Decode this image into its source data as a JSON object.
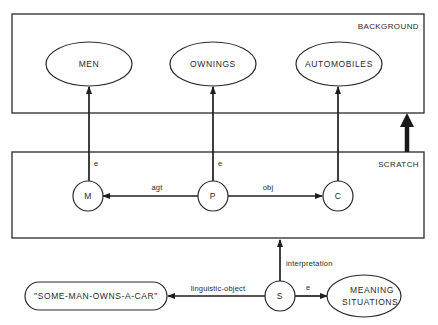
{
  "colors": {
    "ink": "#2a2a2a",
    "background": "#ffffff"
  },
  "boxes": {
    "background": {
      "label": "BACKGROUND"
    },
    "scratch": {
      "label": "SCRATCH"
    }
  },
  "concepts": {
    "men": "MEN",
    "ownings": "OWNINGS",
    "automobiles": "AUTOMOBILES"
  },
  "nodes": {
    "m": "M",
    "p": "P",
    "c": "C",
    "s": "S"
  },
  "edges": {
    "m_to_men": "e",
    "p_to_ownings": "e",
    "c_to_automobiles": "e",
    "p_to_m": "agt",
    "p_to_c": "obj",
    "s_to_scratch": "interpretation",
    "s_to_string": "linguistic-object",
    "s_to_meaning": "e"
  },
  "string_node": "\"SOME-MAN-OWNS-A-CAR\"",
  "meaning_situations": {
    "line1": "MEANING",
    "line2": "SITUATIONS"
  }
}
